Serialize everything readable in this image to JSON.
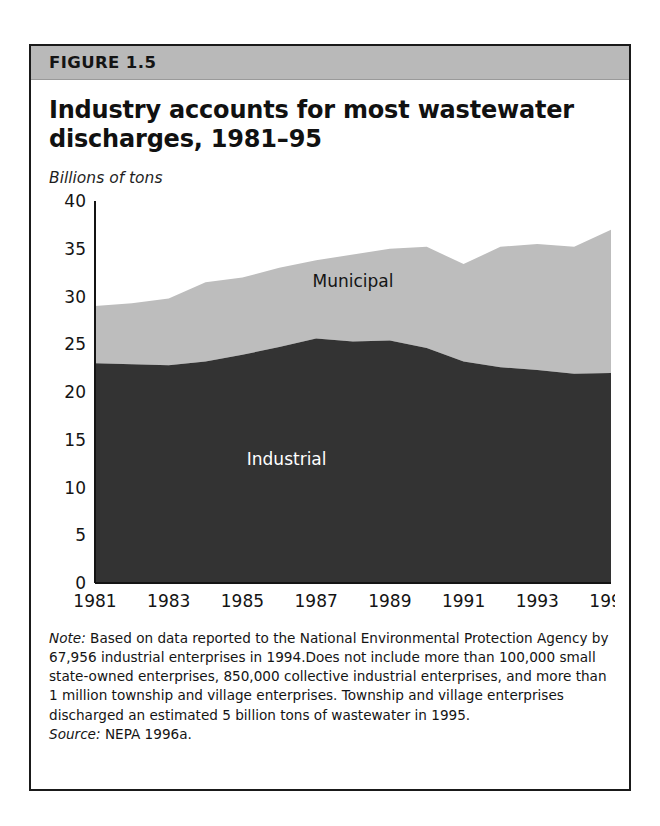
{
  "figure": {
    "number_label": "FIGURE 1.5",
    "title": "Industry accounts for most wastewater discharges, 1981–95",
    "unit_label": "Billions of tons",
    "note_lead": "Note:",
    "note_body": " Based on data reported to the National Environmental Protection Agency by 67,956 industrial enterprises in 1994.Does not include more than 100,000 small state-owned enterprises, 850,000 collective industrial enterprises, and more than 1 million township and village enterprises. Township and village enterprises discharged an estimated 5 billion tons of wastewater in 1995.",
    "source_lead": "Source:",
    "source_body": " NEPA 1996a."
  },
  "colors": {
    "industrial_fill": "#333333",
    "municipal_fill": "#bdbdbd",
    "axis": "#141414",
    "header_bar": "#b9b9b9",
    "card_border": "#1a1a1a",
    "industrial_label_text": "#ffffff",
    "municipal_label_text": "#141414"
  },
  "chart_data": {
    "type": "area",
    "stacked": true,
    "title": "Industry accounts for most wastewater discharges, 1981–95",
    "xlabel": "",
    "ylabel": "Billions of tons",
    "ylim": [
      0,
      40
    ],
    "ytick_step": 5,
    "yticks": [
      "40",
      "35",
      "30",
      "25",
      "20",
      "15",
      "10",
      "5",
      "0"
    ],
    "ytick_values": [
      40,
      35,
      30,
      25,
      20,
      15,
      10,
      5,
      0
    ],
    "grid": false,
    "legend_position": "inline-annotations",
    "x": [
      1981,
      1982,
      1983,
      1984,
      1985,
      1986,
      1987,
      1988,
      1989,
      1990,
      1991,
      1992,
      1993,
      1994,
      1995
    ],
    "xtick_labels": [
      "1981",
      "1983",
      "1985",
      "1987",
      "1989",
      "1991",
      "1993",
      "1995"
    ],
    "xtick_values": [
      1981,
      1983,
      1985,
      1987,
      1989,
      1991,
      1993,
      1995
    ],
    "series": [
      {
        "name": "Industrial",
        "color": "#333333",
        "values": [
          23.0,
          22.9,
          22.8,
          23.2,
          23.9,
          24.7,
          25.6,
          25.3,
          25.4,
          24.6,
          23.2,
          22.6,
          22.3,
          21.9,
          22.0
        ]
      },
      {
        "name": "Municipal",
        "color": "#bdbdbd",
        "values": [
          6.0,
          6.4,
          7.0,
          8.3,
          8.1,
          8.3,
          8.2,
          9.1,
          9.6,
          10.6,
          10.2,
          12.6,
          13.2,
          13.3,
          15.0
        ]
      }
    ],
    "totals": [
      29.0,
      29.3,
      29.8,
      31.5,
      32.0,
      33.0,
      33.8,
      34.4,
      35.0,
      35.2,
      33.4,
      35.2,
      35.5,
      35.2,
      37.0
    ],
    "annotations": [
      {
        "text": "Municipal",
        "x": 1988.0,
        "y": 31.0
      },
      {
        "text": "Industrial",
        "x": 1986.2,
        "y": 12.4
      }
    ]
  }
}
